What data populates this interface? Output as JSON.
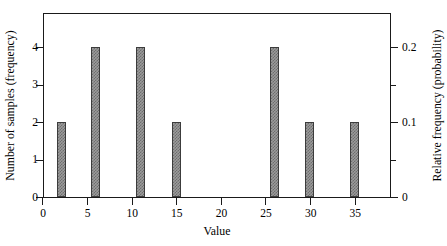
{
  "chart_data": {
    "type": "bar",
    "title": "",
    "subtitle": "",
    "xlabel": "Value",
    "ylabel": "Number of samples (frequency)",
    "ylabel_right": "Relative frequency (probability)",
    "xlim": [
      0,
      39
    ],
    "ylim": [
      0,
      4.93
    ],
    "ylim_right": [
      0,
      0.2465
    ],
    "grid": false,
    "legend": null,
    "bar_width": 1.0,
    "x": [
      1.5,
      5.3,
      10.3,
      14.3,
      25.3,
      29.3,
      34.3
    ],
    "values": [
      2,
      4,
      4,
      2,
      4,
      2,
      2
    ],
    "values_right": [
      0.1,
      0.2,
      0.2,
      0.1,
      0.2,
      0.1,
      0.1
    ],
    "bars": [
      {
        "x": 1.5,
        "frequency": 2,
        "relative_frequency": 0.1
      },
      {
        "x": 5.3,
        "frequency": 4,
        "relative_frequency": 0.2
      },
      {
        "x": 10.3,
        "frequency": 4,
        "relative_frequency": 0.2
      },
      {
        "x": 14.3,
        "frequency": 2,
        "relative_frequency": 0.1
      },
      {
        "x": 25.3,
        "frequency": 4,
        "relative_frequency": 0.2
      },
      {
        "x": 29.3,
        "frequency": 2,
        "relative_frequency": 0.1
      },
      {
        "x": 34.3,
        "frequency": 2,
        "relative_frequency": 0.1
      }
    ],
    "xticks": [
      {
        "value": 0,
        "label": "0"
      },
      {
        "value": 5,
        "label": "5"
      },
      {
        "value": 10,
        "label": "10"
      },
      {
        "value": 15,
        "label": "15"
      },
      {
        "value": 20,
        "label": "20"
      },
      {
        "value": 25,
        "label": "25"
      },
      {
        "value": 30,
        "label": "30"
      },
      {
        "value": 35,
        "label": "35"
      }
    ],
    "yticks_left": [
      {
        "value": 0,
        "label": "0"
      },
      {
        "value": 1,
        "label": "1"
      },
      {
        "value": 2,
        "label": "2"
      },
      {
        "value": 3,
        "label": "3"
      },
      {
        "value": 4,
        "label": "4"
      }
    ],
    "yticks_right": [
      {
        "value": 0,
        "label": "0",
        "minor": false
      },
      {
        "value": 0.05,
        "label": "",
        "minor": true
      },
      {
        "value": 0.1,
        "label": "0.1",
        "minor": false
      },
      {
        "value": 0.15,
        "label": "",
        "minor": true
      },
      {
        "value": 0.2,
        "label": "0.2",
        "minor": false
      }
    ],
    "colors": {
      "bar_fill": "#9b9b9b",
      "bar_hatch": "#6e6e6e",
      "bar_edge": "#3c3c3c",
      "axis": "#1a1a1a",
      "background": "#ffffff",
      "text": "#000000"
    }
  }
}
